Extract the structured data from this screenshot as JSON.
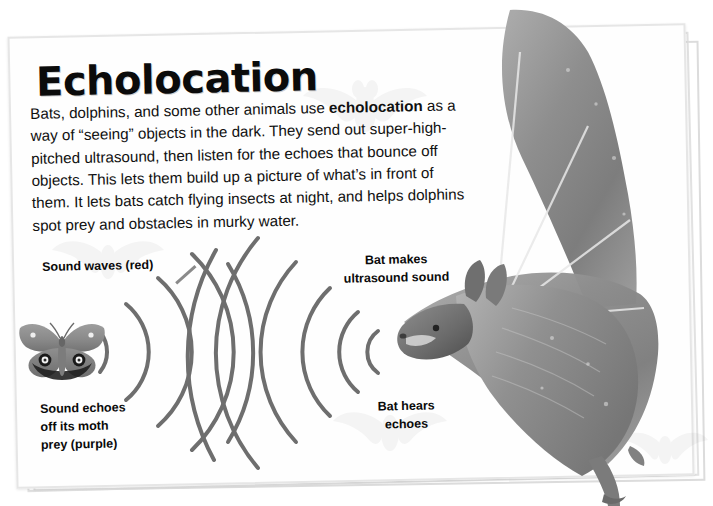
{
  "page": {
    "title": "Echolocation",
    "background_color": "#ffffff",
    "card_color": "#fefefe",
    "frame_border_color": "#e0e0e0"
  },
  "body": {
    "text_before_bold": "Bats, dolphins, and some other animals use ",
    "bold_term": "echolocation",
    "text_after_bold": " as a way of “seeing” objects in the dark. They send out super-high-pitched ultrasound, then listen for the echoes that bounce off objects. This lets them build up a picture of what’s in front of them. It lets bats catch flying insects at night, and helps dolphins spot prey and obstacles in murky water."
  },
  "labels": {
    "sound_waves": "Sound waves (red)",
    "sound_echoes": "Sound echoes\noff its moth\nprey (purple)",
    "bat_makes": "Bat makes\nultrasound sound",
    "bat_hears": "Bat hears\nechoes"
  },
  "diagram": {
    "wave_color": "#6e6e6e",
    "wave_stroke_width": 4,
    "outgoing_waves_label": "red",
    "echo_waves_label": "purple",
    "outgoing_arc_count": 6,
    "echo_arc_count": 5,
    "bat_source_x": 400,
    "bat_source_y": 350,
    "moth_source_x": 70,
    "moth_source_y": 350
  },
  "imagery": {
    "moth": "moth-photo",
    "bat": "bat-photo",
    "watermark": "faint-bat-watermark"
  }
}
